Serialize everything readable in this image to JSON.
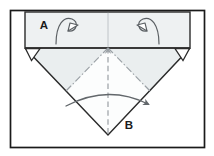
{
  "figure": {
    "kind": "origami-fold-diagram",
    "background_color": "#ffffff",
    "frame": {
      "stroke_color": "#1a1a1a",
      "stroke_width": 1.6,
      "x": 10,
      "y": 10,
      "width": 195,
      "height": 138
    },
    "paper_fill": "#f4f6f7",
    "paper_stroke": "#3a3a3a",
    "crease_color": "#8e9499",
    "arrow_color": "#5d6166"
  },
  "labels": [
    {
      "id": "label-a",
      "text": "A",
      "x": 44,
      "y": 25,
      "font_size": 11
    },
    {
      "id": "label-b",
      "text": "B",
      "x": 128,
      "y": 128,
      "font_size": 11
    }
  ],
  "shapes": {
    "top_band": {
      "name": "top-flap-band",
      "x1": 25,
      "y1": 12,
      "x2": 190,
      "y2": 48,
      "fill": "#eef1f2"
    },
    "band_center_line": {
      "x": 108,
      "y1": 12,
      "y2": 48
    },
    "triangle": {
      "name": "folded-triangle",
      "left": {
        "x": 25,
        "y": 48
      },
      "right": {
        "x": 190,
        "y": 48
      },
      "apex": {
        "x": 108,
        "y": 135
      },
      "fill": "#fdfefe"
    },
    "upper_inner_region": {
      "name": "shaded-inner-flap",
      "fill": "#eceff0",
      "points": "25,48 190,48 150,90 108,48 66,90"
    },
    "corner_markers": [
      {
        "id": "corner-marker-left",
        "points": "25,48 40,48 31,60"
      },
      {
        "id": "corner-marker-right",
        "points": "175,48 190,48 184,60"
      }
    ],
    "mountain_folds": [
      {
        "id": "mountain-fold-left",
        "x1": 108,
        "y1": 48,
        "x2": 66,
        "y2": 92
      },
      {
        "id": "mountain-fold-right",
        "x1": 108,
        "y1": 48,
        "x2": 150,
        "y2": 92
      }
    ],
    "valley_fold_center": {
      "id": "valley-fold-center",
      "x1": 108,
      "y1": 48,
      "x2": 108,
      "y2": 135
    }
  },
  "arrows": {
    "fold_under_left": {
      "name": "fold-under-arrow-left",
      "style": "hollow-loop",
      "stroke": "#5a5f63"
    },
    "fold_under_right": {
      "name": "fold-under-arrow-right",
      "style": "hollow-loop",
      "stroke": "#5a5f63"
    },
    "sweep_bottom": {
      "name": "fold-sweep-arrow",
      "style": "solid-head",
      "stroke": "#62676b",
      "from_x": 66,
      "from_y": 104,
      "to_x": 152,
      "to_y": 104
    }
  }
}
